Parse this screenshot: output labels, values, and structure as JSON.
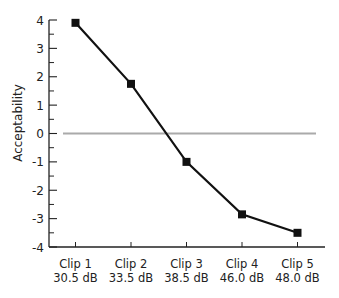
{
  "chart_data": {
    "type": "line",
    "title": "",
    "xlabel": "",
    "ylabel": "Acceptability",
    "categories": [
      [
        "Clip 1",
        "30.5 dB"
      ],
      [
        "Clip 2",
        "33.5 dB"
      ],
      [
        "Clip 3",
        "38.5 dB"
      ],
      [
        "Clip 4",
        "46.0 dB"
      ],
      [
        "Clip 5",
        "48.0 dB"
      ]
    ],
    "series": [
      {
        "name": "Acceptability",
        "values": [
          3.9,
          1.75,
          -1.0,
          -2.85,
          -3.5
        ],
        "color": "#111111",
        "marker": "square"
      }
    ],
    "reference_line": {
      "y": 0,
      "color": "#aaaaaa"
    },
    "ylim": [
      -4,
      4
    ],
    "yticks": [
      4,
      3,
      2,
      1,
      0,
      -1,
      -2,
      -3,
      -4
    ],
    "grid": false,
    "legend": "none"
  },
  "ylabel": "Acceptability"
}
